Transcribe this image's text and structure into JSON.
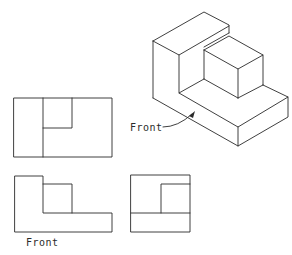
{
  "diagram": {
    "type": "orthographic-projection",
    "views": {
      "isometric": {
        "label": "Front",
        "leader": true
      },
      "top": {
        "label": ""
      },
      "front": {
        "label": "Front"
      },
      "right_side": {
        "label": ""
      }
    }
  },
  "colors": {
    "line": "#2a2a2a",
    "background": "#ffffff"
  }
}
